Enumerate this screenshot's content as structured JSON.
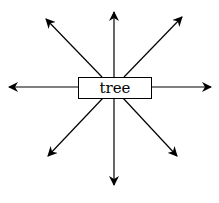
{
  "diagram": {
    "center_label": "tree",
    "arrows": [
      {
        "direction": "up",
        "x1": 114,
        "y1": 77,
        "x2": 114,
        "y2": 12
      },
      {
        "direction": "down",
        "x1": 114,
        "y1": 98,
        "x2": 114,
        "y2": 185
      },
      {
        "direction": "left",
        "x1": 78,
        "y1": 87,
        "x2": 9,
        "y2": 87
      },
      {
        "direction": "right",
        "x1": 151,
        "y1": 87,
        "x2": 211,
        "y2": 87
      },
      {
        "direction": "up-left",
        "x1": 102,
        "y1": 77,
        "x2": 46,
        "y2": 19
      },
      {
        "direction": "up-right",
        "x1": 124,
        "y1": 77,
        "x2": 182,
        "y2": 17
      },
      {
        "direction": "down-left",
        "x1": 103,
        "y1": 98,
        "x2": 48,
        "y2": 156
      },
      {
        "direction": "down-right",
        "x1": 123,
        "y1": 98,
        "x2": 177,
        "y2": 156
      }
    ],
    "stroke_color": "#000000"
  }
}
